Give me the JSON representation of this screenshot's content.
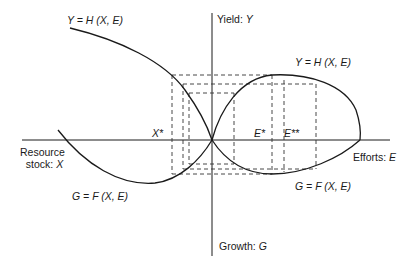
{
  "diagram": {
    "axes": {
      "yield_label": "Yield:",
      "yield_var": "Y",
      "growth_label": "Growth:",
      "growth_var": "G",
      "resource_label_line1": "Resource",
      "resource_label_line2": "stock:",
      "resource_var": "X",
      "efforts_label": "Efforts:",
      "efforts_var": "E"
    },
    "curves": {
      "yield_left": "Y = H (X, E)",
      "yield_right": "Y = H (X, E)",
      "growth_left": "G = F (X, E)",
      "growth_right": "G = F (X, E)"
    },
    "markers": {
      "x_star": "X*",
      "e_star": "E*",
      "e_star_star": "E**"
    },
    "colors": {
      "line": "#1a1a1a",
      "background": "#ffffff"
    }
  }
}
